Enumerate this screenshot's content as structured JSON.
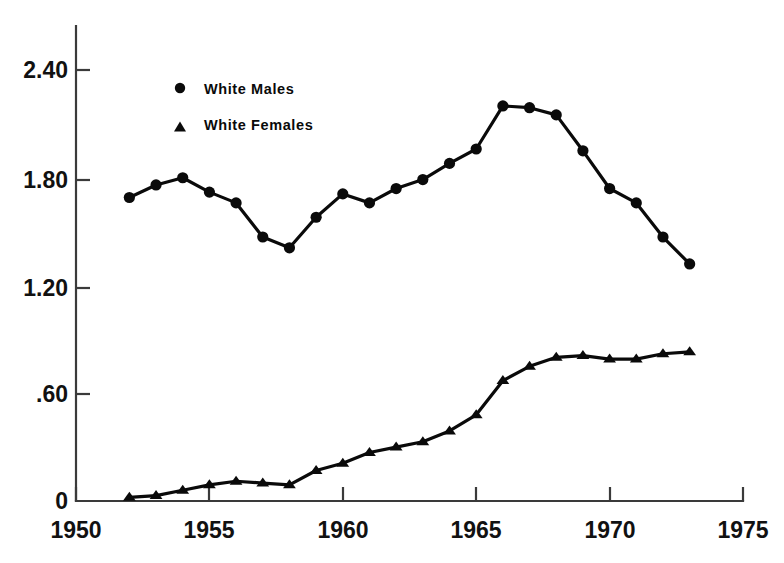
{
  "chart_data": {
    "type": "line",
    "title": "",
    "subtitle": "",
    "xlabel": "",
    "ylabel": "",
    "xlim": [
      1950,
      1975
    ],
    "ylim": [
      0,
      2.7
    ],
    "grid": false,
    "legend_position": "upper-left-inside",
    "x_ticks": [
      "1950",
      "1955",
      "1960",
      "1965",
      "1970",
      "1975"
    ],
    "x_tick_values": [
      1950,
      1955,
      1960,
      1965,
      1970,
      1975
    ],
    "y_ticks": [
      "0",
      ".60",
      "1.20",
      "1.80",
      "2.40"
    ],
    "y_tick_values": [
      0,
      0.6,
      1.2,
      1.8,
      2.4
    ],
    "x": [
      1952,
      1953,
      1954,
      1955,
      1956,
      1957,
      1958,
      1959,
      1960,
      1961,
      1962,
      1963,
      1964,
      1965,
      1966,
      1967,
      1968,
      1969,
      1970,
      1971,
      1972,
      1973
    ],
    "series": [
      {
        "name": "White Males",
        "marker": "circle",
        "values": [
          1.69,
          1.76,
          1.8,
          1.72,
          1.66,
          1.47,
          1.41,
          1.58,
          1.71,
          1.66,
          1.74,
          1.79,
          1.88,
          1.96,
          2.2,
          2.19,
          2.15,
          1.95,
          1.74,
          1.66,
          1.47,
          1.32
        ]
      },
      {
        "name": "White Females",
        "marker": "triangle",
        "values": [
          0.02,
          0.03,
          0.06,
          0.09,
          0.11,
          0.1,
          0.09,
          0.17,
          0.21,
          0.27,
          0.3,
          0.33,
          0.39,
          0.48,
          0.67,
          0.75,
          0.8,
          0.81,
          0.79,
          0.79,
          0.82,
          0.83
        ]
      }
    ],
    "legend": [
      {
        "label": "White Males",
        "marker": "circle"
      },
      {
        "label": "White Females",
        "marker": "triangle"
      }
    ]
  },
  "axes": {
    "y_tick_0": "0",
    "y_tick_1": ".60",
    "y_tick_2": "1.20",
    "y_tick_3": "1.80",
    "y_tick_4": "2.40",
    "x_tick_0": "1950",
    "x_tick_1": "1955",
    "x_tick_2": "1960",
    "x_tick_3": "1965",
    "x_tick_4": "1970",
    "x_tick_5": "1975"
  },
  "legend": {
    "series_1_label": "White Males",
    "series_2_label": "White Females"
  },
  "colors": {
    "ink": "#0a0a0a",
    "axis": "#3a3a3a",
    "background": "#ffffff"
  }
}
